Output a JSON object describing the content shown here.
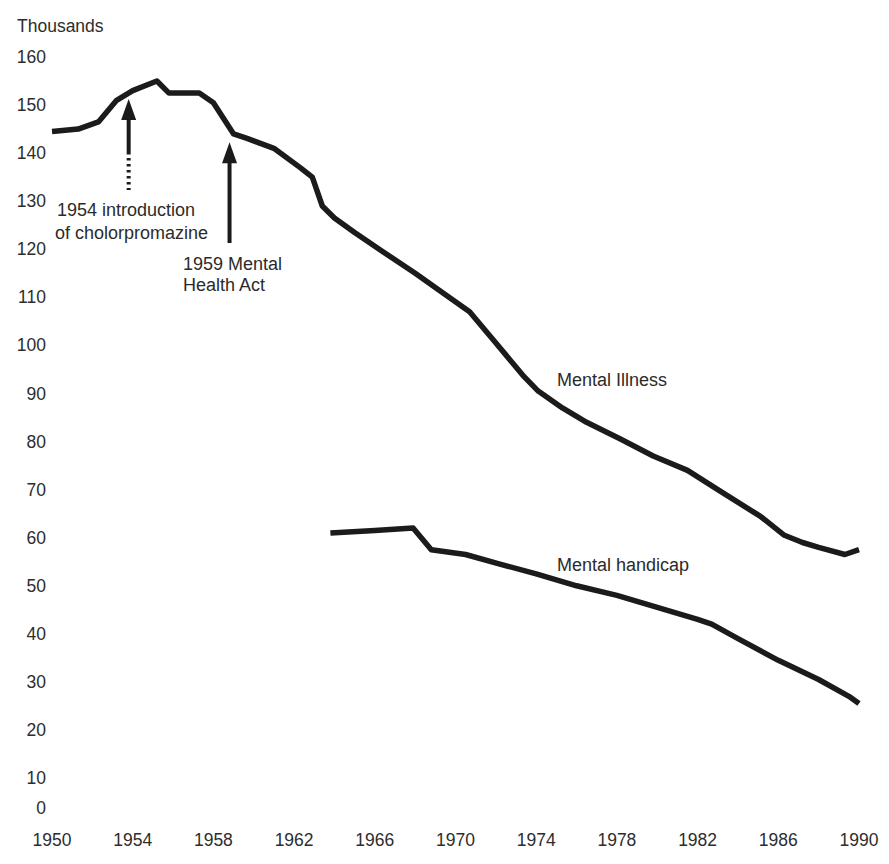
{
  "page": {
    "background_color": "#ffffff",
    "line_color": "#1b1b1b",
    "text_color": "#2b2b2b"
  },
  "chart_data": {
    "type": "line",
    "title": "",
    "y_axis_title": "Thousands",
    "xlabel": "",
    "ylabel": "Thousands",
    "xlim": [
      1950,
      1990
    ],
    "ylim": [
      0,
      160
    ],
    "x_ticks": [
      1950,
      1954,
      1958,
      1962,
      1966,
      1970,
      1974,
      1978,
      1982,
      1986,
      1990
    ],
    "y_ticks": [
      160,
      150,
      140,
      130,
      120,
      110,
      100,
      90,
      80,
      70,
      60,
      50,
      40,
      30,
      20,
      10,
      0
    ],
    "grid": false,
    "axes_lines": false,
    "legend_position": "inline-labels-on-lines",
    "series": [
      {
        "name": "Mental Illness",
        "points": [
          [
            1950,
            144.5
          ],
          [
            1951.3,
            145
          ],
          [
            1952.3,
            146.5
          ],
          [
            1953.2,
            151
          ],
          [
            1954,
            153
          ],
          [
            1955.2,
            155
          ],
          [
            1955.8,
            152.5
          ],
          [
            1957.3,
            152.5
          ],
          [
            1958,
            150.5
          ],
          [
            1959,
            144
          ],
          [
            1959.7,
            143
          ],
          [
            1961,
            141
          ],
          [
            1962.3,
            137
          ],
          [
            1962.9,
            135
          ],
          [
            1963.4,
            129
          ],
          [
            1964,
            126.5
          ],
          [
            1965,
            123.5
          ],
          [
            1966.4,
            119.5
          ],
          [
            1968,
            115
          ],
          [
            1969.7,
            110
          ],
          [
            1970.7,
            107
          ],
          [
            1972,
            100.5
          ],
          [
            1973.4,
            93.5
          ],
          [
            1974.1,
            90.5
          ],
          [
            1975.3,
            87
          ],
          [
            1976.5,
            84
          ],
          [
            1978.2,
            80.5
          ],
          [
            1979.8,
            77
          ],
          [
            1981.5,
            74
          ],
          [
            1983,
            70
          ],
          [
            1984.9,
            65
          ],
          [
            1985.1,
            64.5
          ],
          [
            1986.3,
            60.5
          ],
          [
            1987.2,
            59
          ],
          [
            1988,
            58
          ],
          [
            1989.3,
            56.5
          ],
          [
            1990,
            57.5
          ]
        ]
      },
      {
        "name": "Mental handicap",
        "points": [
          [
            1963.8,
            61
          ],
          [
            1966,
            61.5
          ],
          [
            1967.9,
            62
          ],
          [
            1968.8,
            57.5
          ],
          [
            1970.5,
            56.5
          ],
          [
            1972.2,
            54.5
          ],
          [
            1974,
            52.5
          ],
          [
            1976,
            50
          ],
          [
            1978,
            48
          ],
          [
            1980,
            45.5
          ],
          [
            1982,
            43
          ],
          [
            1982.7,
            42
          ],
          [
            1984,
            39
          ],
          [
            1986,
            34.5
          ],
          [
            1988,
            30.5
          ],
          [
            1989.5,
            27
          ],
          [
            1990,
            25.5
          ]
        ]
      }
    ],
    "annotations": [
      {
        "lines": [
          "1954 introduction",
          "of cholorpromazine"
        ],
        "arrow_points_to": {
          "year": 1953.8,
          "value": 152.5
        }
      },
      {
        "lines": [
          "1959 Mental",
          "Health Act"
        ],
        "arrow_points_to": {
          "year": 1958.8,
          "value": 143.5
        }
      }
    ]
  }
}
